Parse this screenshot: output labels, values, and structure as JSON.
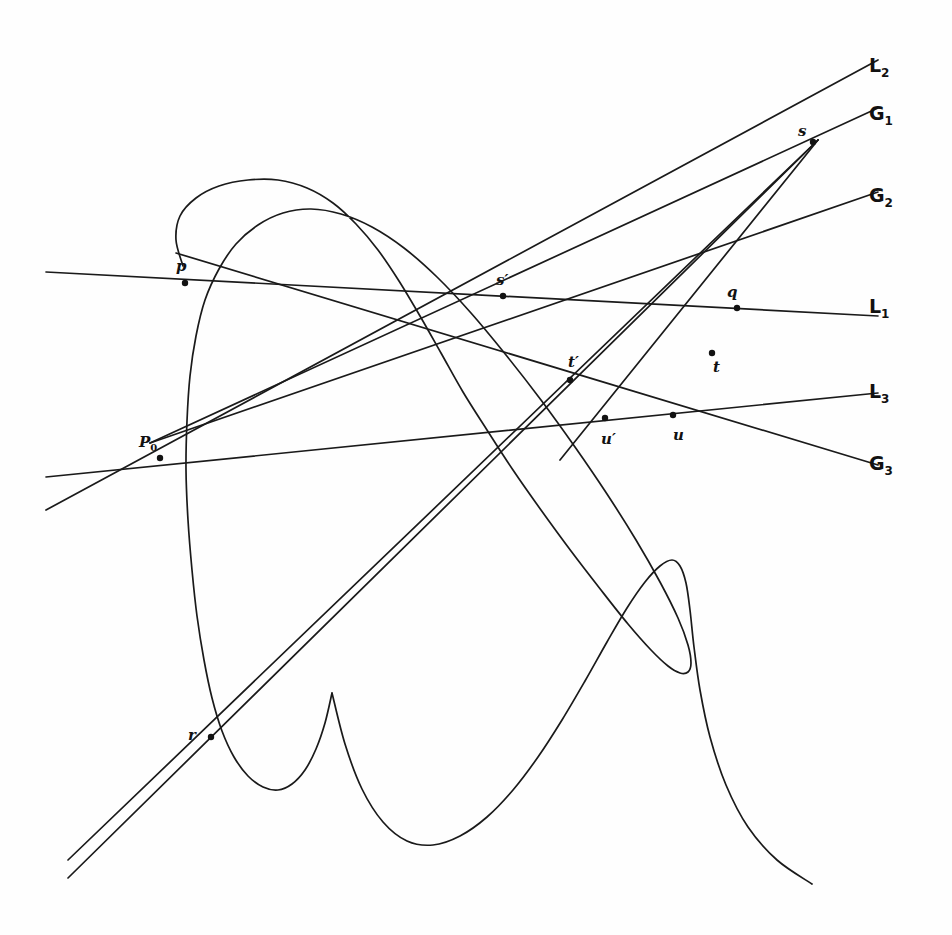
{
  "figure": {
    "background_color": "#fefefe",
    "ink_color": "#1a1a1a",
    "width": 952,
    "height": 935
  },
  "chart_data": {
    "type": "line",
    "xlabel": "",
    "ylabel": "",
    "xlim": [
      0,
      952
    ],
    "ylim": [
      0,
      935
    ],
    "grid": false,
    "legend": "right-margin",
    "series": [
      {
        "name": "oval-branch",
        "kind": "closed-curve",
        "points": [
          [
            183,
            266
          ],
          [
            176,
            240
          ],
          [
            180,
            216
          ],
          [
            196,
            198
          ],
          [
            219,
            186
          ],
          [
            248,
            180
          ],
          [
            278,
            180
          ],
          [
            307,
            188
          ],
          [
            333,
            203
          ],
          [
            356,
            224
          ],
          [
            378,
            250
          ],
          [
            399,
            281
          ],
          [
            420,
            316
          ],
          [
            441,
            353
          ],
          [
            463,
            392
          ],
          [
            487,
            430
          ],
          [
            513,
            470
          ],
          [
            541,
            510
          ],
          [
            571,
            551
          ],
          [
            601,
            590
          ],
          [
            628,
            624
          ],
          [
            651,
            650
          ],
          [
            668,
            666
          ],
          [
            680,
            673
          ],
          [
            688,
            672
          ],
          [
            691,
            663
          ],
          [
            688,
            645
          ],
          [
            678,
            618
          ],
          [
            660,
            582
          ],
          [
            636,
            540
          ],
          [
            607,
            494
          ],
          [
            575,
            447
          ],
          [
            541,
            400
          ],
          [
            506,
            355
          ],
          [
            471,
            313
          ],
          [
            437,
            277
          ],
          [
            404,
            248
          ],
          [
            372,
            227
          ],
          [
            341,
            214
          ],
          [
            311,
            209
          ],
          [
            283,
            213
          ],
          [
            258,
            225
          ],
          [
            236,
            244
          ],
          [
            219,
            269
          ],
          [
            205,
            300
          ],
          [
            196,
            336
          ],
          [
            190,
            376
          ],
          [
            187,
            421
          ],
          [
            186,
            470
          ],
          [
            188,
            520
          ],
          [
            192,
            570
          ],
          [
            197,
            616
          ],
          [
            204,
            660
          ],
          [
            212,
            698
          ],
          [
            222,
            731
          ],
          [
            234,
            757
          ],
          [
            248,
            776
          ],
          [
            263,
            787
          ],
          [
            278,
            790
          ],
          [
            292,
            784
          ],
          [
            305,
            770
          ],
          [
            316,
            749
          ],
          [
            325,
            723
          ],
          [
            332,
            693
          ]
        ]
      },
      {
        "name": "serpentine-branch",
        "kind": "open-curve",
        "points": [
          [
            176,
            240
          ],
          [
            180,
            216
          ],
          [
            196,
            198
          ]
        ]
      },
      {
        "name": "lower-wave",
        "kind": "open-curve",
        "points": [
          [
            332,
            693
          ],
          [
            345,
            744
          ],
          [
            362,
            789
          ],
          [
            383,
            822
          ],
          [
            407,
            841
          ],
          [
            433,
            845
          ],
          [
            460,
            836
          ],
          [
            487,
            817
          ],
          [
            513,
            790
          ],
          [
            538,
            757
          ],
          [
            562,
            720
          ],
          [
            585,
            681
          ],
          [
            607,
            642
          ],
          [
            627,
            608
          ],
          [
            645,
            582
          ],
          [
            660,
            566
          ],
          [
            672,
            560
          ],
          [
            680,
            566
          ],
          [
            686,
            583
          ],
          [
            690,
            610
          ],
          [
            694,
            647
          ],
          [
            700,
            690
          ],
          [
            710,
            737
          ],
          [
            726,
            785
          ],
          [
            748,
            827
          ],
          [
            777,
            860
          ],
          [
            812,
            884
          ]
        ]
      }
    ],
    "lines": [
      {
        "name": "L1",
        "label": "L₁",
        "label_position": [
          869,
          313
        ],
        "x1": 46,
        "y1": 272,
        "x2": 878,
        "y2": 316,
        "note": "near-horizontal line through p, s', q"
      },
      {
        "name": "L2",
        "label": "L₂",
        "label_position": [
          869,
          72
        ],
        "x1": 46,
        "y1": 510,
        "x2": 878,
        "y2": 60,
        "note": "rising line from lower left through t', s"
      },
      {
        "name": "L3",
        "label": "L₃",
        "label_position": [
          869,
          398
        ],
        "x1": 46,
        "y1": 477,
        "x2": 878,
        "y2": 393,
        "note": "near-horizontal lower line through P0, u', u"
      },
      {
        "name": "G1",
        "label": "G₁",
        "label_position": [
          869,
          120
        ],
        "x1": 150,
        "y1": 443,
        "x2": 878,
        "y2": 108,
        "note": "line from P0 rising to the right through t' toward G1"
      },
      {
        "name": "G2",
        "label": "G₂",
        "label_position": [
          869,
          202
        ],
        "x1": 150,
        "y1": 443,
        "x2": 878,
        "y2": 192,
        "note": "second line from P0 rising to G2 through t"
      },
      {
        "name": "G3",
        "label": "G₃",
        "label_position": [
          869,
          470
        ],
        "x1": 176,
        "y1": 253,
        "x2": 878,
        "y2": 465,
        "note": "line from p descending to the right through t' and u"
      },
      {
        "name": "pr-s",
        "label": "",
        "label_position": null,
        "x1": 68,
        "y1": 878,
        "x2": 818,
        "y2": 140,
        "note": "steep line through r and s"
      },
      {
        "name": "r-s-secondary",
        "label": "",
        "label_position": null,
        "x1": 68,
        "y1": 860,
        "x2": 818,
        "y2": 140,
        "note": "second steep line through r toward s"
      },
      {
        "name": "s-u-prime",
        "label": "",
        "label_position": null,
        "x1": 818,
        "y1": 140,
        "x2": 560,
        "y2": 460,
        "note": "line descending from s through q and u'"
      }
    ],
    "points": [
      {
        "label": "p",
        "x": 185,
        "y": 283,
        "label_x": 180,
        "label_y": 268
      },
      {
        "label": "P₀",
        "x": 160,
        "y": 458,
        "label_x": 143,
        "label_y": 443
      },
      {
        "label": "s'",
        "x": 503,
        "y": 296,
        "label_x": 499,
        "label_y": 282
      },
      {
        "label": "t'",
        "x": 570,
        "y": 380,
        "label_x": 572,
        "label_y": 364
      },
      {
        "label": "u'",
        "x": 605,
        "y": 418,
        "label_x": 606,
        "label_y": 440
      },
      {
        "label": "u",
        "x": 673,
        "y": 415,
        "label_x": 676,
        "label_y": 437
      },
      {
        "label": "q",
        "x": 737,
        "y": 308,
        "label_x": 730,
        "label_y": 295
      },
      {
        "label": "t",
        "x": 712,
        "y": 353,
        "label_x": 716,
        "label_y": 370
      },
      {
        "label": "s",
        "x": 813,
        "y": 142,
        "label_x": 801,
        "label_y": 132
      },
      {
        "label": "r",
        "x": 211,
        "y": 737,
        "label_x": 191,
        "label_y": 736
      }
    ]
  },
  "margin_labels": [
    {
      "base": "L",
      "sub": "2",
      "x": 869,
      "y": 72,
      "name": "line-label-L2"
    },
    {
      "base": "G",
      "sub": "1",
      "x": 869,
      "y": 120,
      "name": "line-label-G1"
    },
    {
      "base": "G",
      "sub": "2",
      "x": 869,
      "y": 202,
      "name": "line-label-G2"
    },
    {
      "base": "L",
      "sub": "1",
      "x": 869,
      "y": 313,
      "name": "line-label-L1"
    },
    {
      "base": "L",
      "sub": "3",
      "x": 869,
      "y": 398,
      "name": "line-label-L3"
    },
    {
      "base": "G",
      "sub": "3",
      "x": 869,
      "y": 470,
      "name": "line-label-G3"
    }
  ],
  "point_labels": [
    {
      "base": "p",
      "sub": "",
      "x": 176,
      "y": 271,
      "name": "point-label-p"
    },
    {
      "base": "P",
      "sub": "0",
      "x": 139,
      "y": 447,
      "name": "point-label-P0"
    },
    {
      "base": "s",
      "sub": "",
      "x": 496,
      "y": 285,
      "prime": true,
      "name": "point-label-s-prime"
    },
    {
      "base": "t",
      "sub": "",
      "x": 568,
      "y": 367,
      "prime": true,
      "name": "point-label-t-prime"
    },
    {
      "base": "u",
      "sub": "",
      "x": 601,
      "y": 444,
      "prime": true,
      "name": "point-label-u-prime"
    },
    {
      "base": "u",
      "sub": "",
      "x": 673,
      "y": 440,
      "prime": false,
      "name": "point-label-u"
    },
    {
      "base": "q",
      "sub": "",
      "x": 727,
      "y": 297,
      "prime": false,
      "name": "point-label-q"
    },
    {
      "base": "t",
      "sub": "",
      "x": 713,
      "y": 372,
      "prime": false,
      "name": "point-label-t"
    },
    {
      "base": "s",
      "sub": "",
      "x": 798,
      "y": 136,
      "prime": false,
      "name": "point-label-s"
    },
    {
      "base": "r",
      "sub": "",
      "x": 188,
      "y": 740,
      "prime": false,
      "name": "point-label-r"
    }
  ]
}
